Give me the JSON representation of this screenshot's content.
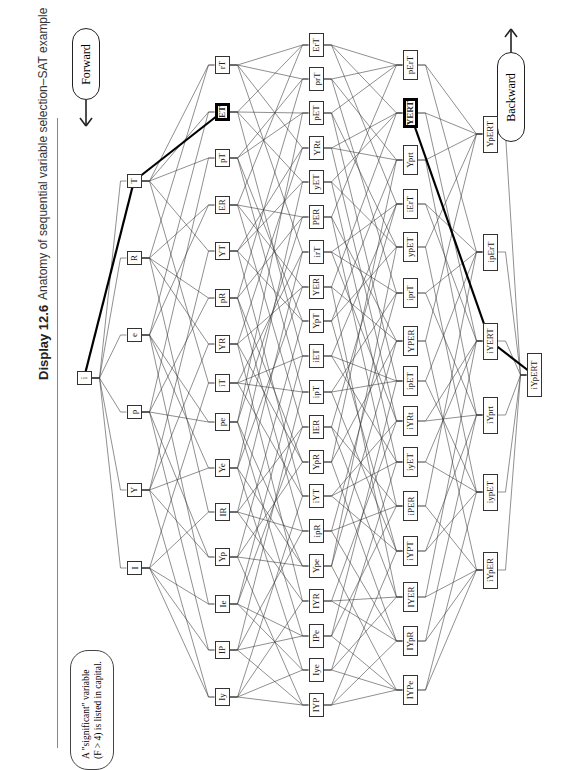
{
  "header": {
    "display_label": "Display 12.6",
    "title": "Anatomy of sequential variable selection–SAT example"
  },
  "legend": {
    "line1": "A \"significant\" variable",
    "line2": "(F > 4) is listed in capital."
  },
  "directions": {
    "forward": "Forward",
    "backward": "Backward"
  },
  "colors": {
    "node_border": "#333333",
    "edge": "#333333",
    "path_highlight": "#000000",
    "text": "#222222"
  },
  "columns": [
    {
      "x": 84,
      "nodes": [
        {
          "id": "root",
          "label": "i",
          "y": 378
        }
      ]
    },
    {
      "x": 134,
      "nodes": [
        {
          "id": "T",
          "label": "T",
          "y": 181
        },
        {
          "id": "R",
          "label": "R",
          "y": 258
        },
        {
          "id": "e",
          "label": "e",
          "y": 335
        },
        {
          "id": "p",
          "label": "p",
          "y": 412
        },
        {
          "id": "Y",
          "label": "Y",
          "y": 490
        },
        {
          "id": "I",
          "label": "I",
          "y": 568
        }
      ]
    },
    {
      "x": 222,
      "nodes": [
        {
          "id": "rT",
          "label": "rT",
          "y": 65
        },
        {
          "id": "ET",
          "label": "ET",
          "y": 112,
          "bold": true
        },
        {
          "id": "pT",
          "label": "pT",
          "y": 158
        },
        {
          "id": "ER",
          "label": "ER",
          "y": 205
        },
        {
          "id": "YT",
          "label": "YT",
          "y": 251
        },
        {
          "id": "pR",
          "label": "pR",
          "y": 298
        },
        {
          "id": "YR",
          "label": "YR",
          "y": 344
        },
        {
          "id": "iT",
          "label": "iT",
          "y": 383
        },
        {
          "id": "pe",
          "label": "pe",
          "y": 422
        },
        {
          "id": "Ye",
          "label": "Ye",
          "y": 468
        },
        {
          "id": "IR",
          "label": "IR",
          "y": 512
        },
        {
          "id": "Yp",
          "label": "Yp",
          "y": 557
        },
        {
          "id": "Ie",
          "label": "Ie",
          "y": 604
        },
        {
          "id": "IP",
          "label": "IP",
          "y": 650
        },
        {
          "id": "Iy",
          "label": "Iy",
          "y": 697
        }
      ]
    },
    {
      "x": 316,
      "nodes": [
        {
          "id": "ErT",
          "label": "ErT",
          "y": 45
        },
        {
          "id": "prT",
          "label": "prT",
          "y": 79
        },
        {
          "id": "pET",
          "label": "pET",
          "y": 113
        },
        {
          "id": "YRt",
          "label": "YRt",
          "y": 148
        },
        {
          "id": "yET",
          "label": "yET",
          "y": 182
        },
        {
          "id": "PER",
          "label": "PER",
          "y": 217
        },
        {
          "id": "irT",
          "label": "irT",
          "y": 252
        },
        {
          "id": "YER",
          "label": "YER",
          "y": 287
        },
        {
          "id": "YpT",
          "label": "YpT",
          "y": 321
        },
        {
          "id": "iET",
          "label": "iET",
          "y": 356
        },
        {
          "id": "ipT",
          "label": "ipT",
          "y": 392
        },
        {
          "id": "IER",
          "label": "IER",
          "y": 427
        },
        {
          "id": "YpR",
          "label": "YpR",
          "y": 462
        },
        {
          "id": "iYT",
          "label": "iYT",
          "y": 496
        },
        {
          "id": "ipR",
          "label": "ipR",
          "y": 531
        },
        {
          "id": "Ype",
          "label": "Ype",
          "y": 566
        },
        {
          "id": "IYR",
          "label": "IYR",
          "y": 601
        },
        {
          "id": "IPe",
          "label": "IPe",
          "y": 636
        },
        {
          "id": "Iye",
          "label": "Iye",
          "y": 670
        },
        {
          "id": "IYP",
          "label": "IYP",
          "y": 705
        }
      ]
    },
    {
      "x": 410,
      "nodes": [
        {
          "id": "pErT",
          "label": "pErT",
          "y": 65
        },
        {
          "id": "YERT",
          "label": "YERT",
          "y": 113,
          "bold": true
        },
        {
          "id": "Yprt",
          "label": "Yprt",
          "y": 160
        },
        {
          "id": "iErT",
          "label": "iErT",
          "y": 204
        },
        {
          "id": "ypET",
          "label": "ypET",
          "y": 247
        },
        {
          "id": "iprT",
          "label": "iprT",
          "y": 293
        },
        {
          "id": "YPER",
          "label": "YPER",
          "y": 341
        },
        {
          "id": "ipET",
          "label": "ipET",
          "y": 381
        },
        {
          "id": "iYRt",
          "label": "iYRt",
          "y": 421
        },
        {
          "id": "iyET",
          "label": "iyET",
          "y": 462
        },
        {
          "id": "iPER",
          "label": "iPER",
          "y": 506
        },
        {
          "id": "iYPT",
          "label": "iYPT",
          "y": 551
        },
        {
          "id": "IYER",
          "label": "IYER",
          "y": 597
        },
        {
          "id": "IYpR",
          "label": "IYpR",
          "y": 641
        },
        {
          "id": "IYPe",
          "label": "IYPe",
          "y": 690
        }
      ]
    },
    {
      "x": 490,
      "nodes": [
        {
          "id": "YpERT",
          "label": "YpERT",
          "y": 134
        },
        {
          "id": "ipErT",
          "label": "ipErT",
          "y": 252
        },
        {
          "id": "iYERT",
          "label": "iYERT",
          "y": 341
        },
        {
          "id": "iYprt",
          "label": "iYprt",
          "y": 415
        },
        {
          "id": "iypET",
          "label": "iypET",
          "y": 492
        },
        {
          "id": "iYpER",
          "label": "iYpER",
          "y": 570
        }
      ]
    },
    {
      "x": 534,
      "nodes": [
        {
          "id": "iYpERT",
          "label": "iYpERT",
          "y": 375
        }
      ]
    }
  ],
  "highlight_path_forward": [
    "root",
    "T",
    "ET"
  ],
  "highlight_path_backward": [
    "iYpERT",
    "iYERT",
    "YERT"
  ]
}
